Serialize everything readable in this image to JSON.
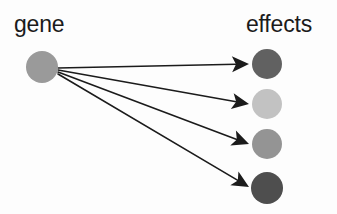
{
  "figure": {
    "background_color": "#fdfdfd",
    "width": 337,
    "height": 214
  },
  "labels": {
    "source": "gene",
    "target": "effects"
  },
  "source_node": {
    "name": "gene",
    "cx": 42,
    "cy": 67,
    "r": 16,
    "color": "#9a9a9a"
  },
  "target_nodes": [
    {
      "name": "effect-1",
      "cx": 267,
      "cy": 64,
      "r": 15,
      "color": "#616161"
    },
    {
      "name": "effect-2",
      "cx": 267,
      "cy": 104,
      "r": 15,
      "color": "#c2c2c2"
    },
    {
      "name": "effect-3",
      "cx": 267,
      "cy": 144,
      "r": 15,
      "color": "#949494"
    },
    {
      "name": "effect-4",
      "cx": 267,
      "cy": 188,
      "r": 16,
      "color": "#4e4e4e"
    }
  ],
  "arrows": [
    {
      "name": "arrow-to-effect-1",
      "x1": 58,
      "y1": 68,
      "x2": 249,
      "y2": 64,
      "color": "#1b1b1b"
    },
    {
      "name": "arrow-to-effect-2",
      "x1": 58,
      "y1": 70,
      "x2": 249,
      "y2": 104,
      "color": "#1b1b1b"
    },
    {
      "name": "arrow-to-effect-3",
      "x1": 58,
      "y1": 72,
      "x2": 249,
      "y2": 144,
      "color": "#1b1b1b"
    },
    {
      "name": "arrow-to-effect-4",
      "x1": 58,
      "y1": 74,
      "x2": 249,
      "y2": 187,
      "color": "#1b1b1b"
    }
  ],
  "label_positions": {
    "source": {
      "x": 14,
      "y": 32
    },
    "target": {
      "x": 246,
      "y": 32
    }
  },
  "style": {
    "line_width": 1.6,
    "arrowhead_length": 17,
    "arrowhead_half_width": 8,
    "arrowhead_notch": 4
  }
}
